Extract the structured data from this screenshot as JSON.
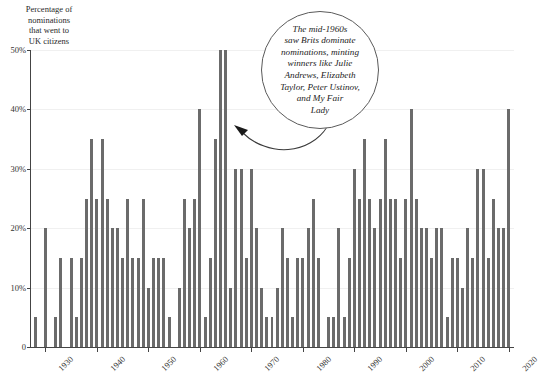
{
  "chart_data": {
    "type": "bar",
    "title": "",
    "subtitle": "",
    "xlabel": "",
    "ylabel": "Percentage of\nnominations\nthat went to\nUK citizens",
    "ylim": [
      0,
      50
    ],
    "xlim": [
      1927,
      2021
    ],
    "grid": true,
    "legend": null,
    "y_ticks": [
      0,
      10,
      20,
      30,
      40,
      50
    ],
    "y_tick_labels": [
      "0",
      "10%",
      "20%",
      "30%",
      "40%",
      "50%"
    ],
    "x_ticks": [
      1930,
      1940,
      1950,
      1960,
      1970,
      1980,
      1990,
      2000,
      2010,
      2020
    ],
    "x_tick_labels": [
      "1930",
      "1940",
      "1950",
      "1960",
      "1970",
      "1980",
      "1990",
      "2000",
      "2010",
      "2020"
    ],
    "bar_color": "#6b6b6b",
    "categories": [
      1928,
      1929,
      1930,
      1931,
      1932,
      1933,
      1934,
      1935,
      1936,
      1937,
      1938,
      1939,
      1940,
      1941,
      1942,
      1943,
      1944,
      1945,
      1946,
      1947,
      1948,
      1949,
      1950,
      1951,
      1952,
      1953,
      1954,
      1955,
      1956,
      1957,
      1958,
      1959,
      1960,
      1961,
      1962,
      1963,
      1964,
      1965,
      1966,
      1967,
      1968,
      1969,
      1970,
      1971,
      1972,
      1973,
      1974,
      1975,
      1976,
      1977,
      1978,
      1979,
      1980,
      1981,
      1982,
      1983,
      1984,
      1985,
      1986,
      1987,
      1988,
      1989,
      1990,
      1991,
      1992,
      1993,
      1994,
      1995,
      1996,
      1997,
      1998,
      1999,
      2000,
      2001,
      2002,
      2003,
      2004,
      2005,
      2006,
      2007,
      2008,
      2009,
      2010,
      2011,
      2012,
      2013,
      2014,
      2015,
      2016,
      2017,
      2018,
      2019,
      2020
    ],
    "values": [
      5,
      0,
      20,
      0,
      5,
      15,
      0,
      15,
      5,
      15,
      25,
      35,
      25,
      35,
      25,
      20,
      20,
      15,
      25,
      15,
      15,
      25,
      10,
      15,
      15,
      15,
      5,
      0,
      10,
      25,
      20,
      25,
      40,
      5,
      15,
      35,
      50,
      50,
      10,
      30,
      30,
      15,
      30,
      20,
      10,
      5,
      5,
      10,
      20,
      15,
      5,
      15,
      15,
      20,
      25,
      15,
      0,
      5,
      5,
      20,
      5,
      15,
      30,
      25,
      35,
      25,
      20,
      25,
      35,
      25,
      25,
      15,
      25,
      40,
      25,
      20,
      20,
      15,
      20,
      20,
      5,
      15,
      15,
      10,
      20,
      15,
      30,
      30,
      15,
      25,
      20,
      20,
      40
    ],
    "annotations": [
      {
        "id": "mid-1960s-callout",
        "text": "The mid-1960s\nsaw Brits dominate\nnominations, minting\nwinners like Julie\nAndrews, Elizabeth\nTaylor, Peter Ustinov,\nand My Fair\nLady",
        "points_to_year": 1964,
        "shape": "circle"
      }
    ]
  },
  "axis": {
    "y_caption": "Percentage of\nnominations\nthat went to\nUK citizens"
  },
  "colors": {
    "bar": "#6b6b6b",
    "axis": "#444444",
    "grid": "#f0f0f0",
    "background": "#ffffff",
    "text": "#222222",
    "bubble_outline": "#5a5a5a"
  }
}
